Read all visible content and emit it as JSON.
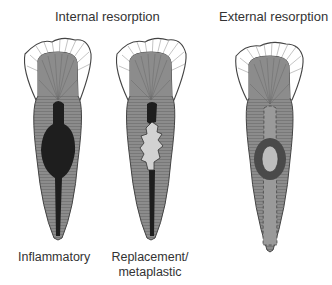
{
  "headings": {
    "internal": "Internal resorption",
    "external": "External resorption"
  },
  "captions": {
    "inflammatory": "Inflammatory",
    "replacement_line1": "Replacement/",
    "replacement_line2": "metaplastic"
  },
  "colors": {
    "enamel": "#ffffff",
    "dentin": "#8c8c8c",
    "outline": "#444444",
    "pulp_dark": "#1e1e1e",
    "replacement_tissue": "#d2d2d2",
    "external_ring": "#4a4a4a",
    "external_center": "#bdbdbd",
    "background": "#ffffff"
  }
}
